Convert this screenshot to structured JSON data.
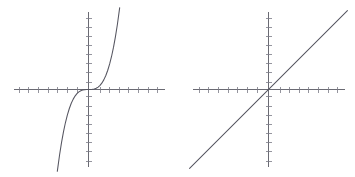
{
  "figure": {
    "title": "",
    "background_color": "#ffffff",
    "width": 355,
    "height": 177,
    "panel_count": 2
  },
  "style": {
    "axis_color": "#5a5a64",
    "tick_color": "#7b7b86",
    "curve_color": "#555560",
    "background": "#ffffff"
  },
  "chart_data": [
    {
      "type": "line",
      "panel": "left",
      "title": "",
      "xlabel": "",
      "ylabel": "",
      "function": "y = x^3",
      "description": "Odd-power monomial: flat inflection at origin, steeply increasing at both ends",
      "xlim": [
        -4,
        4
      ],
      "ylim": [
        -4.1,
        4.1
      ],
      "grid": false,
      "legend": null,
      "axes_style": "centered-crosshair-with-ticks",
      "x_tick_interval": 0.5,
      "y_tick_interval": 0.5,
      "x_ticks": [
        -3.5,
        -3,
        -2.5,
        -2,
        -1.5,
        -1,
        -0.5,
        0,
        0.5,
        1,
        1.5,
        2,
        2.5,
        3,
        3.5
      ],
      "y_ticks": [
        -4,
        -3.5,
        -3,
        -2.5,
        -2,
        -1.5,
        -1,
        -0.5,
        0,
        0.5,
        1,
        1.5,
        2,
        2.5,
        3,
        3.5,
        4
      ],
      "x": [
        -1.62,
        -1.5,
        -1.4,
        -1.3,
        -1.2,
        -1.1,
        -1.0,
        -0.9,
        -0.8,
        -0.7,
        -0.6,
        -0.5,
        -0.4,
        -0.3,
        -0.2,
        -0.1,
        0.0,
        0.1,
        0.2,
        0.3,
        0.4,
        0.5,
        0.6,
        0.7,
        0.8,
        0.9,
        1.0,
        1.1,
        1.2,
        1.3,
        1.4,
        1.5,
        1.62
      ],
      "y": [
        -4.25,
        -3.375,
        -2.744,
        -2.197,
        -1.728,
        -1.331,
        -1.0,
        -0.729,
        -0.512,
        -0.343,
        -0.216,
        -0.125,
        -0.064,
        -0.027,
        -0.008,
        -0.001,
        0.0,
        0.001,
        0.008,
        0.027,
        0.064,
        0.125,
        0.216,
        0.343,
        0.512,
        0.729,
        1.0,
        1.331,
        1.728,
        2.197,
        2.744,
        3.375,
        4.25
      ]
    },
    {
      "type": "line",
      "panel": "right",
      "title": "",
      "xlabel": "",
      "ylabel": "",
      "function": "y = x",
      "description": "Identity line through the origin with slope 1",
      "xlim": [
        -4,
        4
      ],
      "ylim": [
        -4.1,
        4.1
      ],
      "grid": false,
      "legend": null,
      "axes_style": "centered-crosshair-with-ticks",
      "x_tick_interval": 0.5,
      "y_tick_interval": 0.5,
      "x_ticks": [
        -3.5,
        -3,
        -2.5,
        -2,
        -1.5,
        -1,
        -0.5,
        0,
        0.5,
        1,
        1.5,
        2,
        2.5,
        3,
        3.5
      ],
      "y_ticks": [
        -4,
        -3.5,
        -3,
        -2.5,
        -2,
        -1.5,
        -1,
        -0.5,
        0,
        0.5,
        1,
        1.5,
        2,
        2.5,
        3,
        3.5,
        4
      ],
      "slope": 1,
      "intercept": 0,
      "x": [
        -4.1,
        4.1
      ],
      "y": [
        -4.1,
        4.1
      ]
    }
  ]
}
